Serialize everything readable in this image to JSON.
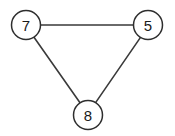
{
  "figure": {
    "background_color": "#ffffff",
    "width": 175,
    "height": 136
  },
  "chart_data": {
    "type": "diagram",
    "diagram_type": "node-link graph",
    "title": "",
    "xlabel": "",
    "ylabel": "",
    "directed": false,
    "nodes": [
      {
        "id": "n7",
        "label": "7",
        "x": 26,
        "y": 25,
        "r": 14.5
      },
      {
        "id": "n5",
        "label": "5",
        "x": 148,
        "y": 25,
        "r": 14.5
      },
      {
        "id": "n8",
        "label": "8",
        "x": 88,
        "y": 115,
        "r": 14.5
      }
    ],
    "edges": [
      {
        "id": "e-7-5",
        "source": "n7",
        "target": "n5",
        "x1": 40.5,
        "y1": 25,
        "x2": 133.5,
        "y2": 25
      },
      {
        "id": "e-7-8",
        "source": "n7",
        "target": "n8",
        "x1": 34.0,
        "y1": 37.2,
        "x2": 80.0,
        "y2": 102.8
      },
      {
        "id": "e-5-8",
        "source": "n5",
        "target": "n8",
        "x1": 140.5,
        "y1": 37.4,
        "x2": 95.6,
        "y2": 102.6
      }
    ],
    "node_style": {
      "fill": "#ffffff",
      "stroke": "#2e2e2e",
      "stroke_width": 1.5,
      "label_color": "#1a1a1a",
      "label_size": 15
    },
    "edge_style": {
      "stroke": "#3a3a3a",
      "stroke_width": 1.6
    }
  }
}
